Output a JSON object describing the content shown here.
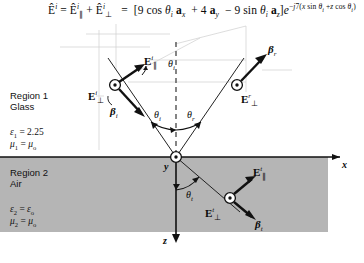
{
  "figure": {
    "type": "physics-ray-diagram",
    "title_equation": {
      "lhs": "Ê^i",
      "decomposition": "Ê^i_∥ + Ê^i_⊥",
      "rhs": "[9 cos θ_i a_x + 4 a_y − 9 sin θ_i a_z] e^{−j7(x sin θ_i + z cos θ_i)}",
      "plain": "Ê^i = Ê^i_∥ + Ê^i_⊥ = [9 cos θi ax + 4 ay − 9 sin θi az] e^−j7(x sin θi + z cos θi)",
      "coefficients": {
        "x_component": 9,
        "y_component": 4,
        "z_component": 9,
        "wavenumber": 7
      }
    },
    "regions": [
      {
        "id": "region1",
        "name": "Region 1",
        "material": "Glass",
        "permittivity_label": "ε",
        "permittivity_sub": "1",
        "permittivity_value": "2.25",
        "permeability_label": "μ",
        "permeability_sub": "1",
        "permeability_value": "μ",
        "permeability_value_sub": "o",
        "fill": "#ffffff"
      },
      {
        "id": "region2",
        "name": "Region 2",
        "material": "Air",
        "permittivity_label": "ε",
        "permittivity_sub": "2",
        "permittivity_value": "ε",
        "permittivity_value_sub": "o",
        "permeability_label": "μ",
        "permeability_sub": "2",
        "permeability_value": "μ",
        "permeability_value_sub": "o",
        "fill": "#b5b5b5"
      }
    ],
    "axes": {
      "x_label": "x",
      "y_label": "y",
      "z_label": "z"
    },
    "angles": [
      {
        "name": "theta-i",
        "symbol": "θ",
        "sub": "i"
      },
      {
        "name": "theta-r",
        "symbol": "θ",
        "sub": "r"
      },
      {
        "name": "theta-t",
        "symbol": "θ",
        "sub": "t"
      },
      {
        "name": "theta-i-polar",
        "symbol": "θ",
        "sub": "i"
      }
    ],
    "vectors": {
      "incident_E_parallel": {
        "E": "E",
        "sup": "i",
        "sub": "∥"
      },
      "incident_E_perp": {
        "E": "E",
        "sup": "i",
        "sub": "⊥"
      },
      "incident_beta": {
        "b": "β",
        "sub": "i"
      },
      "reflected_E_perp": {
        "E": "E",
        "sup": "r",
        "sub": "⊥"
      },
      "reflected_beta": {
        "b": "β",
        "sub": "r"
      },
      "transmitted_E_parallel": {
        "E": "E",
        "sup": "t",
        "sub": "∥"
      },
      "transmitted_E_perp": {
        "E": "E",
        "sup": "t",
        "sub": "⊥"
      },
      "transmitted_beta": {
        "b": "β",
        "sub": "t"
      }
    },
    "colors": {
      "ink": "#111111",
      "region2_fill": "#b5b5b5",
      "paper": "#ffffff",
      "faint_guide": "#c8c8c8"
    }
  }
}
